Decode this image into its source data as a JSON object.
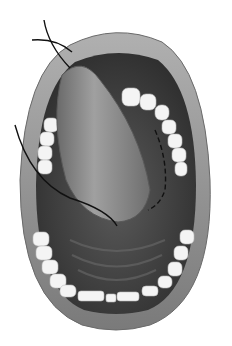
{
  "figure": {
    "style": "grayscale medical illustration",
    "colors": {
      "background": "#ffffff",
      "lip": "#8a8a8a",
      "lip_highlight": "#b8b8b8",
      "cavity": "#3a3a3a",
      "tongue": "#7a7a7a",
      "tongue_highlight": "#a0a0a0",
      "teeth": "#f4f4f4",
      "suture": "#111111"
    }
  }
}
